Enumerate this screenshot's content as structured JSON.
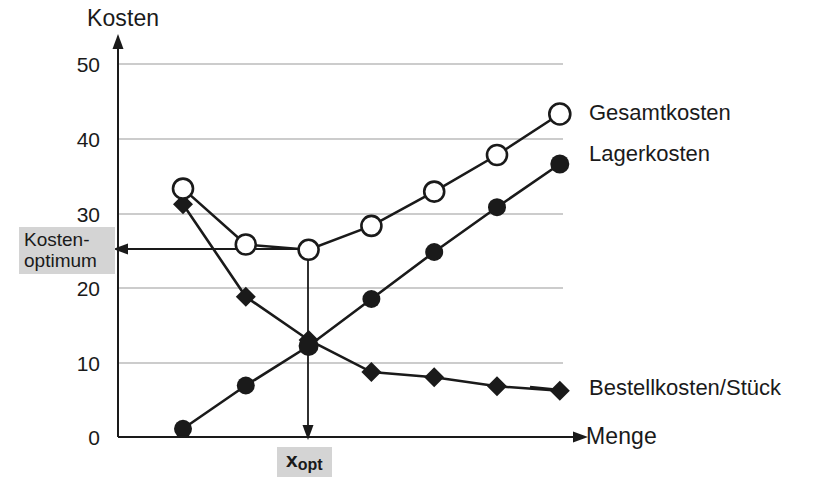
{
  "axes": {
    "y_title": "Kosten",
    "x_title": "Menge",
    "y_ticks": [
      "50",
      "40",
      "30",
      "20",
      "10",
      "0"
    ]
  },
  "annotations": {
    "kosten_optimum_line1": "Kosten-",
    "kosten_optimum_line2": "optimum",
    "x_opt_base": "x",
    "x_opt_sub": "opt",
    "highlight_color": "#d4d4d4"
  },
  "legend": {
    "gesamtkosten": "Gesamtkosten",
    "lagerkosten": "Lagerkosten",
    "bestellkosten": "Bestellkosten/Stück"
  },
  "chart_data": {
    "type": "line",
    "title": "",
    "subtitle": "",
    "xlabel": "Menge",
    "ylabel": "Kosten",
    "ylim": [
      0,
      52
    ],
    "grid": true,
    "grid_axis": "y",
    "yticks": [
      0,
      10,
      20,
      30,
      40,
      50
    ],
    "legend_position": "right-of-plot (direct series labels)",
    "x": [
      1,
      2,
      3,
      4,
      5,
      6,
      7
    ],
    "series": [
      {
        "name": "Gesamtkosten",
        "marker": "open-circle",
        "values": [
          33.3,
          25.8,
          25.1,
          28.3,
          32.9,
          37.8,
          43.3
        ]
      },
      {
        "name": "Lagerkosten",
        "marker": "filled-circle",
        "values": [
          1.1,
          6.9,
          12.2,
          18.5,
          24.8,
          30.8,
          36.6
        ]
      },
      {
        "name": "Bestellkosten/Stück",
        "marker": "filled-diamond",
        "values": [
          31.2,
          18.8,
          13.0,
          8.7,
          8.0,
          6.8,
          6.2
        ]
      }
    ],
    "annotations": [
      {
        "text": "Kosten-optimum",
        "type": "horizontal-arrow",
        "points_to": {
          "x": 3,
          "y": 25.1
        },
        "value": 25.1
      },
      {
        "text": "xopt",
        "type": "vertical-arrow",
        "points_to": {
          "x": 3,
          "y": 0
        },
        "value": 3
      }
    ]
  }
}
